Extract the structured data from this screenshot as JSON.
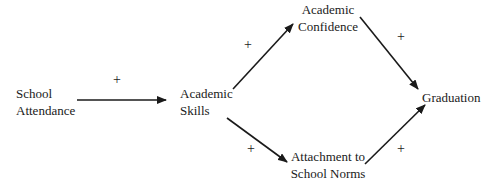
{
  "diagram": {
    "nodes": [
      {
        "id": "school_attendance",
        "lines": [
          "School",
          "Attendance"
        ]
      },
      {
        "id": "academic_skills",
        "lines": [
          "Academic",
          "Skills"
        ]
      },
      {
        "id": "academic_confidence",
        "lines": [
          "Academic",
          "Confidence"
        ]
      },
      {
        "id": "attachment",
        "lines": [
          "Attachment to",
          "School Norms"
        ]
      },
      {
        "id": "graduation",
        "lines": [
          "Graduation"
        ]
      }
    ],
    "edges": [
      {
        "from": "school_attendance",
        "to": "academic_skills",
        "sign": "+"
      },
      {
        "from": "academic_skills",
        "to": "academic_confidence",
        "sign": "+"
      },
      {
        "from": "academic_skills",
        "to": "attachment",
        "sign": "+"
      },
      {
        "from": "academic_confidence",
        "to": "graduation",
        "sign": "+"
      },
      {
        "from": "attachment",
        "to": "graduation",
        "sign": "+"
      }
    ]
  }
}
